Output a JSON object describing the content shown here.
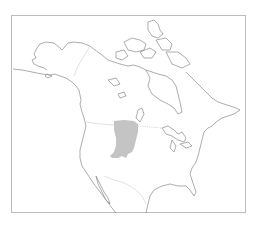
{
  "map": {
    "title_fragment": "",
    "region": "North America",
    "frame": {
      "stroke": "#bdbdbd"
    },
    "colors": {
      "land_fill": "#ffffff",
      "coastline": "#8a8a8a",
      "borders": "#cfcfcf",
      "range_fill": "#c4c4c4"
    },
    "layers": [
      {
        "id": "coastlines",
        "label": "Coastlines"
      },
      {
        "id": "country-borders",
        "label": "Country borders"
      },
      {
        "id": "distribution-range",
        "label": "Distribution range"
      }
    ]
  }
}
